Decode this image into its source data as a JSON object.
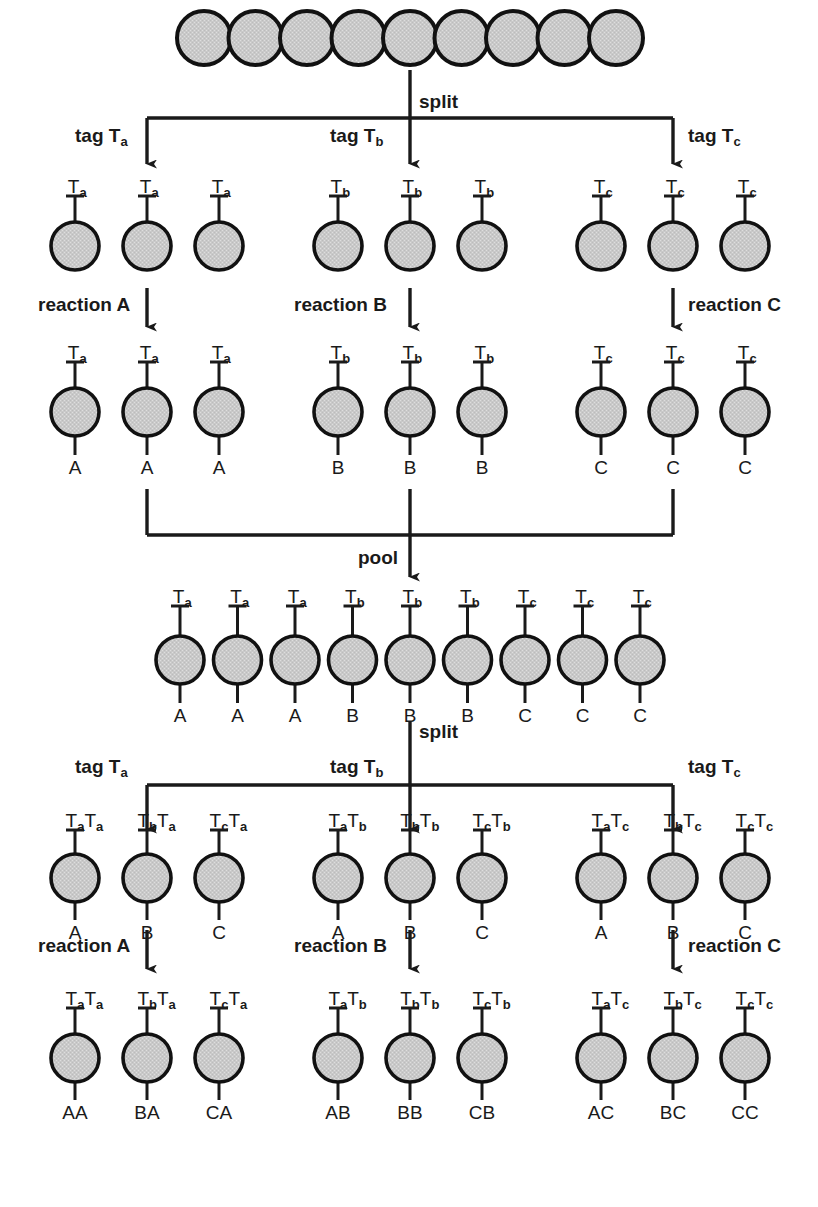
{
  "figure": {
    "bead_fill": "#c9c9c9",
    "bead_stroke": "#111111",
    "line_color": "#1a1a1a"
  },
  "labels": {
    "split": "split",
    "pool": "pool",
    "tag_a": "tag T",
    "tag_b": "tag T",
    "tag_c": "tag T",
    "tag_a_sub": "a",
    "tag_b_sub": "b",
    "tag_c_sub": "c",
    "reaction_a": "reaction A",
    "reaction_b": "reaction B",
    "reaction_c": "reaction C",
    "T": "T"
  },
  "rows": {
    "row0_starting_beads": {
      "name": "starting bead pool",
      "count": 9,
      "beads": [
        {
          "tags": [],
          "product": ""
        },
        {
          "tags": [],
          "product": ""
        },
        {
          "tags": [],
          "product": ""
        },
        {
          "tags": [],
          "product": ""
        },
        {
          "tags": [],
          "product": ""
        },
        {
          "tags": [],
          "product": ""
        },
        {
          "tags": [],
          "product": ""
        },
        {
          "tags": [],
          "product": ""
        },
        {
          "tags": [],
          "product": ""
        }
      ]
    },
    "row1_tagged": {
      "name": "after first tagging",
      "groups": [
        {
          "group_label": "tag T",
          "group_sub": "a",
          "beads": [
            {
              "tags": [
                {
                  "base": "T",
                  "sub": "a"
                }
              ],
              "product": ""
            },
            {
              "tags": [
                {
                  "base": "T",
                  "sub": "a"
                }
              ],
              "product": ""
            },
            {
              "tags": [
                {
                  "base": "T",
                  "sub": "a"
                }
              ],
              "product": ""
            }
          ]
        },
        {
          "group_label": "tag T",
          "group_sub": "b",
          "beads": [
            {
              "tags": [
                {
                  "base": "T",
                  "sub": "b"
                }
              ],
              "product": ""
            },
            {
              "tags": [
                {
                  "base": "T",
                  "sub": "b"
                }
              ],
              "product": ""
            },
            {
              "tags": [
                {
                  "base": "T",
                  "sub": "b"
                }
              ],
              "product": ""
            }
          ]
        },
        {
          "group_label": "tag T",
          "group_sub": "c",
          "beads": [
            {
              "tags": [
                {
                  "base": "T",
                  "sub": "c"
                }
              ],
              "product": ""
            },
            {
              "tags": [
                {
                  "base": "T",
                  "sub": "c"
                }
              ],
              "product": ""
            },
            {
              "tags": [
                {
                  "base": "T",
                  "sub": "c"
                }
              ],
              "product": ""
            }
          ]
        }
      ]
    },
    "row2_reacted": {
      "name": "after first reaction",
      "groups": [
        {
          "group_label": "reaction A",
          "beads": [
            {
              "tags": [
                {
                  "base": "T",
                  "sub": "a"
                }
              ],
              "product": "A"
            },
            {
              "tags": [
                {
                  "base": "T",
                  "sub": "a"
                }
              ],
              "product": "A"
            },
            {
              "tags": [
                {
                  "base": "T",
                  "sub": "a"
                }
              ],
              "product": "A"
            }
          ]
        },
        {
          "group_label": "reaction B",
          "beads": [
            {
              "tags": [
                {
                  "base": "T",
                  "sub": "b"
                }
              ],
              "product": "B"
            },
            {
              "tags": [
                {
                  "base": "T",
                  "sub": "b"
                }
              ],
              "product": "B"
            },
            {
              "tags": [
                {
                  "base": "T",
                  "sub": "b"
                }
              ],
              "product": "B"
            }
          ]
        },
        {
          "group_label": "reaction C",
          "beads": [
            {
              "tags": [
                {
                  "base": "T",
                  "sub": "c"
                }
              ],
              "product": "C"
            },
            {
              "tags": [
                {
                  "base": "T",
                  "sub": "c"
                }
              ],
              "product": "C"
            },
            {
              "tags": [
                {
                  "base": "T",
                  "sub": "c"
                }
              ],
              "product": "C"
            }
          ]
        }
      ]
    },
    "row3_pooled": {
      "name": "pooled beads",
      "count": 9,
      "beads": [
        {
          "tags": [
            {
              "base": "T",
              "sub": "a"
            }
          ],
          "product": "A"
        },
        {
          "tags": [
            {
              "base": "T",
              "sub": "a"
            }
          ],
          "product": "A"
        },
        {
          "tags": [
            {
              "base": "T",
              "sub": "a"
            }
          ],
          "product": "A"
        },
        {
          "tags": [
            {
              "base": "T",
              "sub": "b"
            }
          ],
          "product": "B"
        },
        {
          "tags": [
            {
              "base": "T",
              "sub": "b"
            }
          ],
          "product": "B"
        },
        {
          "tags": [
            {
              "base": "T",
              "sub": "b"
            }
          ],
          "product": "B"
        },
        {
          "tags": [
            {
              "base": "T",
              "sub": "c"
            }
          ],
          "product": "C"
        },
        {
          "tags": [
            {
              "base": "T",
              "sub": "c"
            }
          ],
          "product": "C"
        },
        {
          "tags": [
            {
              "base": "T",
              "sub": "c"
            }
          ],
          "product": "C"
        }
      ]
    },
    "row4_tagged2": {
      "name": "after second tagging",
      "groups": [
        {
          "group_label": "tag T",
          "group_sub": "a",
          "beads": [
            {
              "tags": [
                {
                  "base": "T",
                  "sub": "a"
                },
                {
                  "base": "T",
                  "sub": "a"
                }
              ],
              "product": "A"
            },
            {
              "tags": [
                {
                  "base": "T",
                  "sub": "b"
                },
                {
                  "base": "T",
                  "sub": "a"
                }
              ],
              "product": "B"
            },
            {
              "tags": [
                {
                  "base": "T",
                  "sub": "c"
                },
                {
                  "base": "T",
                  "sub": "a"
                }
              ],
              "product": "C"
            }
          ]
        },
        {
          "group_label": "tag T",
          "group_sub": "b",
          "beads": [
            {
              "tags": [
                {
                  "base": "T",
                  "sub": "a"
                },
                {
                  "base": "T",
                  "sub": "b"
                }
              ],
              "product": "A"
            },
            {
              "tags": [
                {
                  "base": "T",
                  "sub": "b"
                },
                {
                  "base": "T",
                  "sub": "b"
                }
              ],
              "product": "B"
            },
            {
              "tags": [
                {
                  "base": "T",
                  "sub": "c"
                },
                {
                  "base": "T",
                  "sub": "b"
                }
              ],
              "product": "C"
            }
          ]
        },
        {
          "group_label": "tag T",
          "group_sub": "c",
          "beads": [
            {
              "tags": [
                {
                  "base": "T",
                  "sub": "a"
                },
                {
                  "base": "T",
                  "sub": "c"
                }
              ],
              "product": "A"
            },
            {
              "tags": [
                {
                  "base": "T",
                  "sub": "b"
                },
                {
                  "base": "T",
                  "sub": "c"
                }
              ],
              "product": "B"
            },
            {
              "tags": [
                {
                  "base": "T",
                  "sub": "c"
                },
                {
                  "base": "T",
                  "sub": "c"
                }
              ],
              "product": "C"
            }
          ]
        }
      ]
    },
    "row5_reacted2": {
      "name": "after second reaction",
      "groups": [
        {
          "group_label": "reaction A",
          "beads": [
            {
              "tags": [
                {
                  "base": "T",
                  "sub": "a"
                },
                {
                  "base": "T",
                  "sub": "a"
                }
              ],
              "product": "AA"
            },
            {
              "tags": [
                {
                  "base": "T",
                  "sub": "b"
                },
                {
                  "base": "T",
                  "sub": "a"
                }
              ],
              "product": "BA"
            },
            {
              "tags": [
                {
                  "base": "T",
                  "sub": "c"
                },
                {
                  "base": "T",
                  "sub": "a"
                }
              ],
              "product": "CA"
            }
          ]
        },
        {
          "group_label": "reaction B",
          "beads": [
            {
              "tags": [
                {
                  "base": "T",
                  "sub": "a"
                },
                {
                  "base": "T",
                  "sub": "b"
                }
              ],
              "product": "AB"
            },
            {
              "tags": [
                {
                  "base": "T",
                  "sub": "b"
                },
                {
                  "base": "T",
                  "sub": "b"
                }
              ],
              "product": "BB"
            },
            {
              "tags": [
                {
                  "base": "T",
                  "sub": "c"
                },
                {
                  "base": "T",
                  "sub": "b"
                }
              ],
              "product": "CB"
            }
          ]
        },
        {
          "group_label": "reaction C",
          "beads": [
            {
              "tags": [
                {
                  "base": "T",
                  "sub": "a"
                },
                {
                  "base": "T",
                  "sub": "c"
                }
              ],
              "product": "AC"
            },
            {
              "tags": [
                {
                  "base": "T",
                  "sub": "b"
                },
                {
                  "base": "T",
                  "sub": "c"
                }
              ],
              "product": "BC"
            },
            {
              "tags": [
                {
                  "base": "T",
                  "sub": "c"
                },
                {
                  "base": "T",
                  "sub": "c"
                }
              ],
              "product": "CC"
            }
          ]
        }
      ]
    }
  },
  "flow_steps": [
    {
      "id": "split-1",
      "label": "split"
    },
    {
      "id": "pool-1",
      "label": "pool"
    },
    {
      "id": "split-2",
      "label": "split"
    }
  ]
}
